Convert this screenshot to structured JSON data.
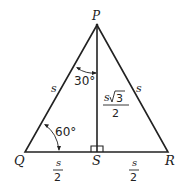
{
  "diagram": {
    "vertices": {
      "P": "P",
      "Q": "Q",
      "R": "R",
      "S": "S"
    },
    "sides": {
      "left": "s",
      "right": "s"
    },
    "angles": {
      "top": "30°",
      "bottom_left": "60°"
    },
    "altitude": {
      "numerator_s": "s",
      "numerator_root": "3",
      "denominator": "2"
    },
    "base_halves": {
      "left": {
        "numerator": "s",
        "denominator": "2"
      },
      "right": {
        "numerator": "s",
        "denominator": "2"
      }
    },
    "colors": {
      "stroke": "#222222",
      "background": "#ffffff"
    }
  }
}
